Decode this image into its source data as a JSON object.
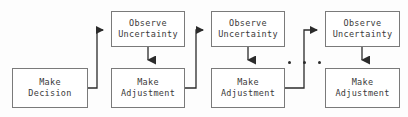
{
  "diagram": {
    "background_color": "#fdfdfd",
    "box_border_color": "#7a7a7a",
    "box_fill_color": "#ffffff",
    "text_color": "#3a3a3a",
    "connector_color": "#2b2b2b",
    "nodes": [
      {
        "id": "make-decision",
        "label": "Make\nDecision",
        "line1": "Make",
        "line2": "Decision",
        "x": 12,
        "y": 68,
        "width": 76,
        "height": 40
      },
      {
        "id": "observe-uncertainty-1",
        "label": "Observe\nUncertainty",
        "line1": "Observe",
        "line2": "Uncertainty",
        "x": 111,
        "y": 11,
        "width": 74,
        "height": 36
      },
      {
        "id": "make-adjustment-1",
        "label": "Make\nAdjustment",
        "line1": "Make",
        "line2": "Adjustment",
        "x": 111,
        "y": 68,
        "width": 74,
        "height": 40
      },
      {
        "id": "observe-uncertainty-2",
        "label": "Observe\nUncertainty",
        "line1": "Observe",
        "line2": "Uncertainty",
        "x": 211,
        "y": 11,
        "width": 74,
        "height": 36
      },
      {
        "id": "make-adjustment-2",
        "label": "Make\nAdjustment",
        "line1": "Make",
        "line2": "Adjustment",
        "x": 211,
        "y": 68,
        "width": 74,
        "height": 40
      },
      {
        "id": "observe-uncertainty-3",
        "label": "Observe\nUncertainty",
        "line1": "Observe",
        "line2": "Uncertainty",
        "x": 325,
        "y": 11,
        "width": 75,
        "height": 36
      },
      {
        "id": "make-adjustment-3",
        "label": "Make\nAdjustment",
        "line1": "Make",
        "line2": "Adjustment",
        "x": 325,
        "y": 68,
        "width": 75,
        "height": 40
      }
    ],
    "ellipsis": {
      "symbol": "...",
      "dot_count": 3,
      "dots": [
        {
          "cx": 289,
          "cy": 62
        },
        {
          "cx": 304,
          "cy": 62
        },
        {
          "cx": 319,
          "cy": 62
        }
      ]
    },
    "connectors": [
      {
        "id": "decision-to-observe-1",
        "from": "make-decision",
        "to": "observe-uncertainty-1",
        "type": "elbow-right-up",
        "arrow_direction": "right"
      },
      {
        "id": "observe-1-to-adjustment-1",
        "from": "observe-uncertainty-1",
        "to": "make-adjustment-1",
        "type": "straight-down",
        "arrow_direction": "down"
      },
      {
        "id": "adjustment-1-to-observe-2",
        "from": "make-adjustment-1",
        "to": "observe-uncertainty-2",
        "type": "elbow-right-up",
        "arrow_direction": "right"
      },
      {
        "id": "observe-2-to-adjustment-2",
        "from": "observe-uncertainty-2",
        "to": "make-adjustment-2",
        "type": "straight-down",
        "arrow_direction": "down"
      },
      {
        "id": "adjustment-2-to-observe-3",
        "from": "make-adjustment-2",
        "to": "observe-uncertainty-3",
        "type": "elbow-right-up",
        "arrow_direction": "right"
      },
      {
        "id": "observe-3-to-adjustment-3",
        "from": "observe-uncertainty-3",
        "to": "make-adjustment-3",
        "type": "straight-down",
        "arrow_direction": "down"
      }
    ]
  }
}
